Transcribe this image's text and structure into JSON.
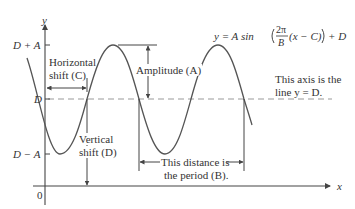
{
  "diagram": {
    "axes": {
      "x_label": "x",
      "y_label": "y",
      "origin_label": "0"
    },
    "y_ticks": [
      {
        "label": "D + A"
      },
      {
        "label": "D"
      },
      {
        "label": "D − A"
      }
    ],
    "equation": {
      "lhs": "y = A sin",
      "frac_num": "2π",
      "frac_den": "B",
      "inner": "(x − C)",
      "rhs": "+ D"
    },
    "annotations": {
      "horizontal_shift_line1": "Horizontal",
      "horizontal_shift_line2": "shift (C)",
      "amplitude": "Amplitude (A)",
      "axis_note_line1": "This axis is the",
      "axis_note_line2": "line y = D.",
      "vertical_shift_line1": "Vertical",
      "vertical_shift_line2": "shift (D)",
      "period_line1": "This distance is",
      "period_line2": "the period (B)."
    },
    "colors": {
      "curve": "#555555",
      "axis": "#444444",
      "dashed_midline": "#999999",
      "text": "#333333"
    }
  }
}
